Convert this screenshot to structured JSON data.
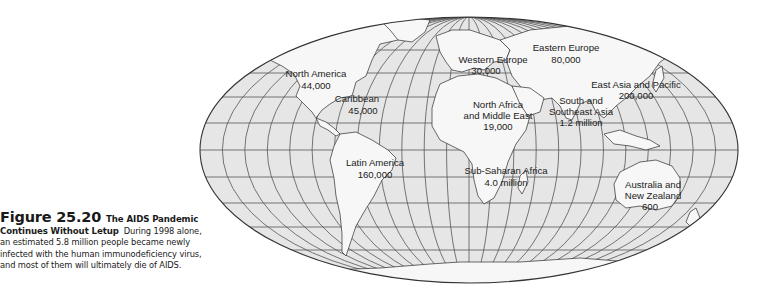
{
  "figure": {
    "number": "Figure 25.20",
    "title_part1": "The AIDS Pandemic",
    "title_part2": "Continues Without Letup",
    "body_line1": "During 1998 alone,",
    "body_line2": "an estimated 5.8 million people became newly",
    "body_line3": "infected with the human immunodeficiency virus,",
    "body_line4": "and most of them will ultimately die of AIDS."
  },
  "map": {
    "projection": "mollweide-style world map",
    "colors": {
      "ocean": "#e6e6e6",
      "land": "#f7f7f7",
      "grid": "#555555",
      "outline": "#333333",
      "text": "#222222"
    },
    "regions": [
      {
        "name_line1": "North America",
        "name_line2": "",
        "value": "44,000"
      },
      {
        "name_line1": "Caribbean",
        "name_line2": "",
        "value": "45,000"
      },
      {
        "name_line1": "Latin America",
        "name_line2": "",
        "value": "160,000"
      },
      {
        "name_line1": "Western Europe",
        "name_line2": "",
        "value": "30,000"
      },
      {
        "name_line1": "Eastern Europe",
        "name_line2": "and Central Asia",
        "value": "80,000"
      },
      {
        "name_line1": "North Africa",
        "name_line2": "and Middle East",
        "value": "19,000"
      },
      {
        "name_line1": "Sub-Saharan Africa",
        "name_line2": "",
        "value": "4.0 million"
      },
      {
        "name_line1": "South and",
        "name_line2": "Southeast Asia",
        "value": "1.2 million"
      },
      {
        "name_line1": "East Asia and Pacific",
        "name_line2": "",
        "value": "200,000"
      },
      {
        "name_line1": "Australia and",
        "name_line2": "New Zealand",
        "value": "600"
      }
    ]
  }
}
